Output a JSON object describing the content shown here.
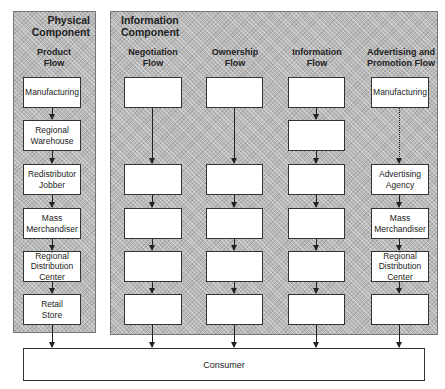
{
  "physical_component": {
    "title": "Physical\nComponent",
    "columns": [
      {
        "header": "Product\nFlow",
        "boxes": [
          "Manufacturing",
          "Regional\nWarehouse",
          "Redistributor\nJobber",
          "Mass\nMerchandiser",
          "Regional\nDistribution\nCenter",
          "Retail\nStore"
        ]
      }
    ]
  },
  "information_component": {
    "title": "Information\nComponent",
    "columns": [
      {
        "header": "Negotiation\nFlow",
        "boxes": [
          "",
          "",
          "",
          "",
          ""
        ]
      },
      {
        "header": "Ownership\nFlow",
        "boxes": [
          "",
          "",
          "",
          "",
          ""
        ]
      },
      {
        "header": "Information\nFlow",
        "boxes": [
          "",
          "",
          "",
          "",
          "",
          ""
        ]
      },
      {
        "header": "Advertising and\nPromotion Flow",
        "boxes": [
          "Manufacturing",
          "Advertising\nAgency",
          "Mass\nMerchandiser",
          "Regional\nDistribution\nCenter",
          ""
        ]
      }
    ]
  },
  "consumer": {
    "label": "Consumer"
  },
  "colors": {
    "panel_fill": "#b9b9b9",
    "box_fill": "#ffffff",
    "stroke": "#333333"
  }
}
